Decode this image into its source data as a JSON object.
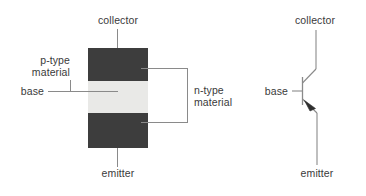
{
  "figure": {
    "colors": {
      "doped_dark": "#3d3d3d",
      "doped_light": "#e9e9e7",
      "leader_line": "#8a8a8a",
      "text": "#3a3a3a",
      "background": "#ffffff"
    }
  },
  "structure_diagram": {
    "labels": {
      "collector": "collector",
      "emitter": "emitter",
      "base": "base",
      "p_type": "p-type\nmaterial",
      "p_type_line1": "p-type",
      "p_type_line2": "material",
      "n_type": "n-type\nmaterial",
      "n_type_line1": "n-type",
      "n_type_line2": "material"
    },
    "layers": [
      {
        "name": "collector-layer",
        "doping": "n-type",
        "shade": "dark"
      },
      {
        "name": "base-layer",
        "doping": "p-type",
        "shade": "light"
      },
      {
        "name": "emitter-layer",
        "doping": "n-type",
        "shade": "dark"
      }
    ]
  },
  "schematic_symbol": {
    "type": "PNP transistor",
    "labels": {
      "collector": "collector",
      "base": "base",
      "emitter": "emitter"
    },
    "arrow_direction": "into-base"
  }
}
